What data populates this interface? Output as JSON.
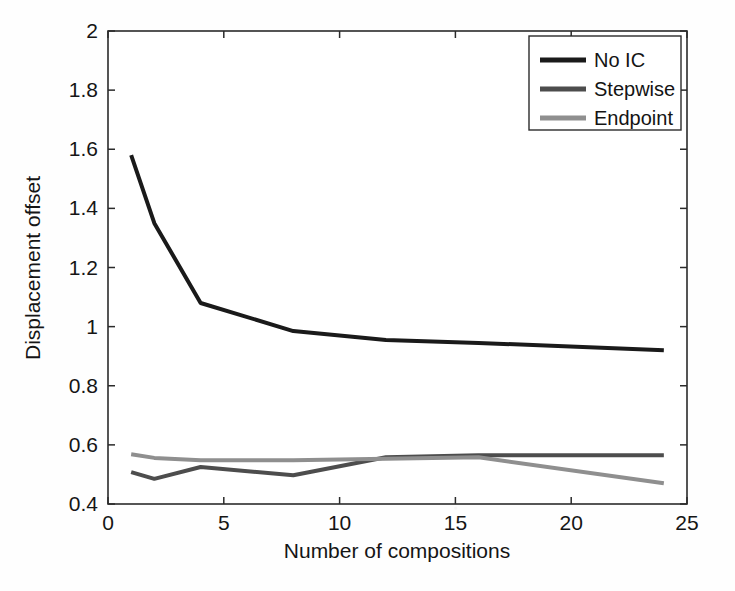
{
  "figure": {
    "background_color": "#ffffff",
    "axes_color": "#2b2b2b"
  },
  "chart_data": {
    "type": "line",
    "title": "",
    "xlabel": "Number of compositions",
    "ylabel": "Displacement offset",
    "xlim": [
      0,
      25
    ],
    "ylim": [
      0.4,
      2
    ],
    "xticks": [
      0,
      5,
      10,
      15,
      20,
      25
    ],
    "xtick_labels": [
      "0",
      "5",
      "10",
      "15",
      "20",
      "25"
    ],
    "yticks": [
      0.4,
      0.6,
      0.8,
      1,
      1.2,
      1.4,
      1.6,
      1.8,
      2
    ],
    "ytick_labels": [
      "0.4",
      "0.6",
      "0.8",
      "1",
      "1.2",
      "1.4",
      "1.6",
      "1.8",
      "2"
    ],
    "grid": false,
    "legend_position": "upper right",
    "x": [
      1,
      2,
      4,
      8,
      12,
      16,
      24
    ],
    "series": [
      {
        "name": "No IC",
        "color": "#1a1a1a",
        "linewidth": 4,
        "values": [
          1.58,
          1.35,
          1.08,
          0.985,
          0.955,
          0.945,
          0.92
        ]
      },
      {
        "name": "Stepwise",
        "color": "#4d4d4d",
        "linewidth": 4,
        "values": [
          0.508,
          0.485,
          0.525,
          0.497,
          0.558,
          0.565,
          0.565
        ]
      },
      {
        "name": "Endpoint",
        "color": "#8f8f8f",
        "linewidth": 4,
        "values": [
          0.568,
          0.556,
          0.548,
          0.548,
          0.553,
          0.558,
          0.47
        ]
      }
    ]
  },
  "legend": {
    "entries": [
      {
        "label": "No IC",
        "color": "#1a1a1a"
      },
      {
        "label": "Stepwise",
        "color": "#4d4d4d"
      },
      {
        "label": "Endpoint",
        "color": "#8f8f8f"
      }
    ]
  }
}
